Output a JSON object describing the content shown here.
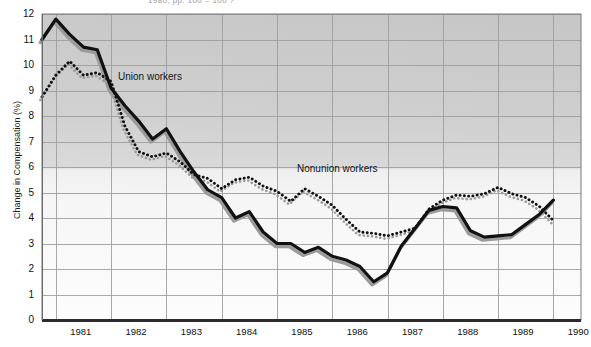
{
  "header": {
    "cut_off_title": "1980, pp. 100 = 100 ?"
  },
  "axes": {
    "ylabel": "Change in Compensation (%)",
    "yticks": [
      "12",
      "11",
      "10",
      "9",
      "8",
      "7",
      "6",
      "5",
      "4",
      "3",
      "2",
      "1",
      "0"
    ],
    "xticks": [
      "1981",
      "1982",
      "1983",
      "1984",
      "1985",
      "1986",
      "1987",
      "1988",
      "1989",
      "1990"
    ]
  },
  "series_labels": {
    "union": "Union workers",
    "nonunion": "Nonunion workers"
  },
  "colors": {
    "union_line": "#111111",
    "nonunion_line": "#111111",
    "shadow": "#9b9b9b",
    "plot_bg_top": "#c9c9c9",
    "plot_bg_bottom": "#fdfdfd",
    "grid": "#b0b0b0",
    "axis": "#3a3a3a",
    "text": "#111111"
  },
  "chart_data": {
    "type": "line",
    "title": "",
    "xlabel": "",
    "ylabel": "Change in Compensation (%)",
    "ylim": [
      0,
      12
    ],
    "xlim": [
      1980.75,
      1990.5
    ],
    "grid": true,
    "legend": "inline-annotations",
    "xticks": [
      1981,
      1982,
      1983,
      1984,
      1985,
      1986,
      1987,
      1988,
      1989,
      1990
    ],
    "yticks": [
      0,
      1,
      2,
      3,
      4,
      5,
      6,
      7,
      8,
      9,
      10,
      11,
      12
    ],
    "x": [
      1980.75,
      1981.0,
      1981.25,
      1981.5,
      1981.75,
      1982.0,
      1982.25,
      1982.5,
      1982.75,
      1983.0,
      1983.25,
      1983.5,
      1983.75,
      1984.0,
      1984.25,
      1984.5,
      1984.75,
      1985.0,
      1985.25,
      1985.5,
      1985.75,
      1986.0,
      1986.25,
      1986.5,
      1986.75,
      1987.0,
      1987.25,
      1987.5,
      1987.75,
      1988.0,
      1988.25,
      1988.5,
      1988.75,
      1989.0,
      1989.25,
      1989.5,
      1989.75,
      1990.0,
      1990.25
    ],
    "series": [
      {
        "name": "Union workers",
        "style": "solid",
        "values": [
          11.0,
          11.8,
          11.2,
          10.7,
          10.6,
          9.1,
          8.4,
          7.8,
          7.1,
          7.5,
          6.6,
          5.8,
          5.1,
          4.8,
          4.0,
          4.25,
          3.45,
          3.0,
          3.0,
          2.65,
          2.85,
          2.5,
          2.35,
          2.1,
          1.5,
          1.85,
          2.9,
          3.6,
          4.3,
          4.45,
          4.4,
          3.5,
          3.25,
          3.3,
          3.35,
          3.75,
          4.15,
          4.7,
          null
        ]
      },
      {
        "name": "Nonunion workers",
        "style": "dotted",
        "values": [
          8.75,
          9.6,
          10.15,
          9.6,
          9.7,
          9.35,
          7.6,
          6.6,
          6.4,
          6.55,
          6.2,
          5.7,
          5.55,
          5.15,
          5.5,
          5.6,
          5.25,
          5.05,
          4.65,
          5.15,
          4.85,
          4.5,
          3.95,
          3.45,
          3.4,
          3.3,
          3.45,
          3.6,
          4.35,
          4.7,
          4.9,
          4.85,
          4.95,
          5.2,
          4.95,
          4.8,
          4.45,
          3.9,
          null
        ]
      }
    ]
  }
}
